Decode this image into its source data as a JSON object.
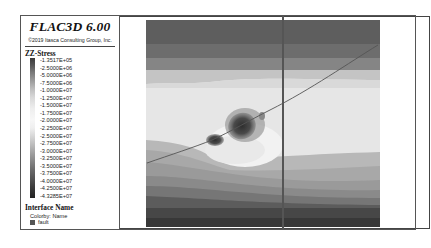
{
  "header": {
    "app_title": "FLAC3D 6.00",
    "copyright": "©2019 Itasca Consulting Group, Inc."
  },
  "legend": {
    "contour": {
      "title": "ZZ-Stress",
      "ticks": [
        "-1.3517E+05",
        "-2.5000E+06",
        "-5.0000E+06",
        "-7.5000E+06",
        "-1.0000E+07",
        "-1.2500E+07",
        "-1.5000E+07",
        "-1.7500E+07",
        "-2.0000E+07",
        "-2.2500E+07",
        "-2.5000E+07",
        "-2.7500E+07",
        "-3.0000E+07",
        "-3.2500E+07",
        "-3.5000E+07",
        "-3.7500E+07",
        "-4.0000E+07",
        "-4.2500E+07",
        "-4.3285E+07"
      ]
    },
    "interface": {
      "title": "Interface Name",
      "colorby": "Colorby: Name",
      "items": [
        {
          "label": "fault",
          "color": "#555555"
        }
      ]
    }
  },
  "plot": {
    "type": "contour",
    "variable": "ZZ-Stress",
    "band_colors_top_to_bottom": [
      "#5c5c5c",
      "#6e6e6e",
      "#8a8a8a",
      "#c9c9c9",
      "#dcdcdc",
      "#e6e6e6",
      "#d4d4d4",
      "#b2b2b2",
      "#a2a2a2",
      "#8e8e8e",
      "#767676",
      "#5a5a5a",
      "#454545"
    ],
    "fault_color": "#555555"
  }
}
